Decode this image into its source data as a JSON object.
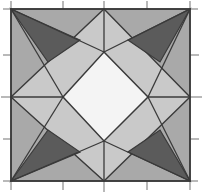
{
  "figure": {
    "width": 208,
    "height": 196,
    "background": "#ffffff"
  },
  "palette": {
    "background": "#ffffff",
    "medium_gray": "#a9a9a9",
    "light_gray": "#c9c9c9",
    "dark_gray": "#5b5b5b",
    "white_center": "#f4f4f4",
    "outline": "#3a3a3a",
    "tick": "#8a8a8a"
  },
  "chart_data": {
    "type": "diagram",
    "xlabel": "",
    "ylabel": "",
    "grid": false,
    "legend": "none",
    "frame": {
      "name": "outer-square",
      "left": 11,
      "top": 9,
      "right": 190,
      "bottom": 181,
      "fill": "#a9a9a9",
      "stroke": "#3a3a3a"
    },
    "midpoints": {
      "top": [
        104,
        9
      ],
      "right": [
        190,
        97
      ],
      "bottom": [
        104,
        181
      ],
      "left": [
        11,
        97
      ]
    },
    "shapes": [
      {
        "name": "background-square",
        "kind": "polygon",
        "fill": "#a9a9a9",
        "stroke": "#3a3a3a",
        "points": "11,9 190,9 190,181 11,181"
      },
      {
        "name": "light-diamond-band",
        "kind": "polygon",
        "fill": "#c9c9c9",
        "stroke": "#3a3a3a",
        "points": "104,9 190,97 104,181 11,97"
      },
      {
        "name": "white-center-diamond",
        "kind": "polygon",
        "fill": "#f4f4f4",
        "stroke": "#3a3a3a",
        "points": "104,52 148,97 104,141 63,97"
      },
      {
        "name": "dark-triangle-top-left",
        "kind": "polygon",
        "fill": "#5b5b5b",
        "stroke": "#3a3a3a",
        "points": "11,9 80,40 48,62"
      },
      {
        "name": "dark-triangle-top-right",
        "kind": "polygon",
        "fill": "#5b5b5b",
        "stroke": "#3a3a3a",
        "points": "190,9 160,62 128,40"
      },
      {
        "name": "dark-triangle-bottom-left",
        "kind": "polygon",
        "fill": "#5b5b5b",
        "stroke": "#3a3a3a",
        "points": "11,181 48,130 80,152"
      },
      {
        "name": "dark-triangle-bottom-right",
        "kind": "polygon",
        "fill": "#5b5b5b",
        "stroke": "#3a3a3a",
        "points": "190,181 128,152 160,130"
      },
      {
        "name": "spoke-top-left",
        "kind": "line",
        "stroke": "#3a3a3a",
        "points": "11,9 104,9"
      },
      {
        "name": "spoke-corner-tl-to-center",
        "kind": "line",
        "stroke": "#3a3a3a",
        "points": "11,9 63,97"
      },
      {
        "name": "spoke-corner-tr-to-center",
        "kind": "line",
        "stroke": "#3a3a3a",
        "points": "190,9 148,97"
      },
      {
        "name": "spoke-corner-bl-to-center",
        "kind": "line",
        "stroke": "#3a3a3a",
        "points": "11,181 63,97"
      },
      {
        "name": "spoke-corner-br-to-center",
        "kind": "line",
        "stroke": "#3a3a3a",
        "points": "190,181 148,97"
      },
      {
        "name": "spoke-top-vertex-down",
        "kind": "line",
        "stroke": "#3a3a3a",
        "points": "104,9 104,52"
      },
      {
        "name": "spoke-bottom-vertex-up",
        "kind": "line",
        "stroke": "#3a3a3a",
        "points": "104,181 104,141"
      },
      {
        "name": "spoke-left-vertex-right",
        "kind": "line",
        "stroke": "#3a3a3a",
        "points": "11,97 63,97"
      },
      {
        "name": "spoke-right-vertex-left",
        "kind": "line",
        "stroke": "#3a3a3a",
        "points": "190,97 148,97"
      }
    ],
    "ticks": {
      "stroke": "#8a8a8a",
      "length": 8,
      "top": [
        63,
        104,
        147
      ],
      "bottom": [
        63,
        104,
        147
      ],
      "left": [
        55,
        97,
        139
      ],
      "right": [
        55,
        97,
        139
      ],
      "corner_top_left": [
        11,
        9
      ]
    }
  }
}
